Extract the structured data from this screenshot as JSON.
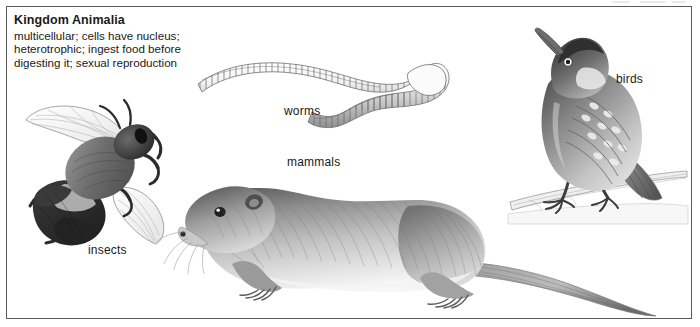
{
  "figure": {
    "caption": {
      "title": "Kingdom Animalia",
      "lines": [
        "multicellular; cells have nucleus;",
        "heterotrophic; ingest food before",
        "digesting it; sexual reproduction"
      ]
    },
    "labels": {
      "insects": "insects",
      "worms": "worms",
      "mammals": "mammals",
      "birds": "birds"
    },
    "illustrations": [
      {
        "name": "bumblebee",
        "label": "insects"
      },
      {
        "name": "earthworm",
        "label": "worms"
      },
      {
        "name": "rodent",
        "label": "mammals"
      },
      {
        "name": "perching-bird",
        "label": "birds"
      }
    ],
    "colors": {
      "background": "#ffffff",
      "border": "#5a5a5a",
      "text": "#1a1a1a",
      "ink_dark": "#4a4a4a",
      "ink_mid": "#8e8e8e",
      "ink_light": "#c9c9c9"
    }
  }
}
